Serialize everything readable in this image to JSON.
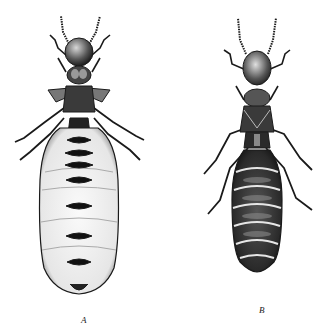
{
  "figure": {
    "specimens": [
      {
        "id": "A",
        "label": "A",
        "form": "wide pale abdomen with dark segment bands"
      },
      {
        "id": "B",
        "label": "B",
        "form": "narrower dark abdomen with pale segment lines"
      }
    ],
    "colors": {
      "ink": "#1a1a1a",
      "paper": "#ffffff",
      "shade": "#555555",
      "pale": "#f2f2f2"
    }
  }
}
